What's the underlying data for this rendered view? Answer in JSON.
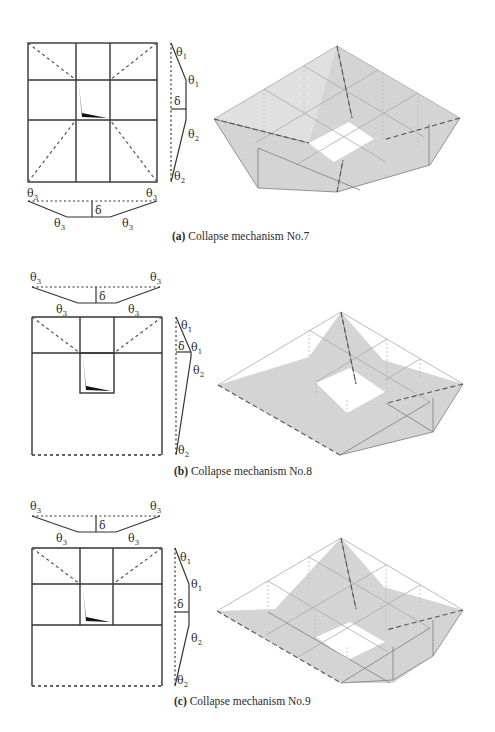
{
  "figures": [
    {
      "id": "a",
      "caption_tag": "(a)",
      "caption_text": "Collapse mechanism No.7",
      "plan": {
        "rows": [
          "cell",
          "cell",
          "cell"
        ],
        "layout": "3x3 grid with center opening, diagonal yield lines in 4 corners"
      },
      "side_profile_labels": [
        "θ1",
        "θ1",
        "δ",
        "θ2",
        "θ2"
      ],
      "bottom_profile_labels": [
        "θ3",
        "θ3",
        "δ",
        "θ3",
        "θ3"
      ]
    },
    {
      "id": "b",
      "caption_tag": "(b)",
      "caption_text": "Collapse mechanism No.8",
      "plan": {
        "layout": "top row of 3 cells with corner diagonals, opening below center, large lower panel with dashed bottom edge"
      },
      "side_profile_labels": [
        "θ1",
        "δ",
        "θ1",
        "θ2",
        "θ2"
      ],
      "top_profile_labels": [
        "θ3",
        "θ3",
        "δ",
        "θ3",
        "θ3"
      ]
    },
    {
      "id": "c",
      "caption_tag": "(c)",
      "caption_text": "Collapse mechanism No.9",
      "plan": {
        "layout": "two rows of 3 cells with top corner diagonals and center opening, lower panel with dashed bottom edge"
      },
      "side_profile_labels": [
        "θ1",
        "θ1",
        "δ",
        "θ2",
        "θ2"
      ],
      "top_profile_labels": [
        "θ3",
        "θ3",
        "δ",
        "θ3",
        "θ3"
      ]
    }
  ],
  "symbols": {
    "theta": "θ",
    "delta": "δ",
    "sub1": "1",
    "sub2": "2",
    "sub3": "3"
  },
  "colors": {
    "line": "#333333",
    "face": "#d4d4d4",
    "face_dark": "#c6c6c6",
    "wire": "#9a9a9a"
  }
}
